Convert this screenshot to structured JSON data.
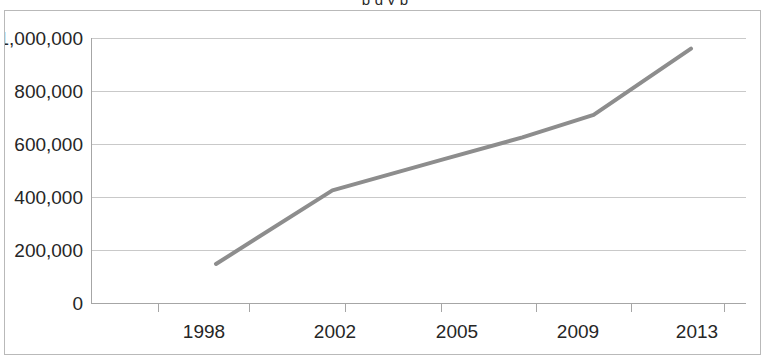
{
  "page": {
    "clipped_caption_above": "p                                      g                              y p"
  },
  "chart_data": {
    "type": "line",
    "title": "",
    "subtitle": "",
    "xlabel": "",
    "ylabel": "",
    "categories": [
      "1998",
      "2002",
      "2005",
      "2009",
      "2013"
    ],
    "x_tick_labels": [
      "1998",
      "2002",
      "2005",
      "2009",
      "2013"
    ],
    "y_tick_labels": [
      "0",
      "200,000",
      "400,000",
      "600,000",
      "800,000",
      "1,000,000"
    ],
    "y_tick_values": [
      0,
      200000,
      400000,
      600000,
      800000,
      1000000
    ],
    "ylim": [
      0,
      1000000
    ],
    "grid": "horizontal",
    "legend": "none",
    "series": [
      {
        "name": "series-1",
        "color": "#8d8d8d",
        "line_width": 4,
        "x": [
          "1998",
          "2002",
          "2005",
          "2007",
          "2009",
          "2013"
        ],
        "values": [
          147000,
          425000,
          543000,
          625000,
          710000,
          960000
        ]
      }
    ],
    "annotations": []
  }
}
